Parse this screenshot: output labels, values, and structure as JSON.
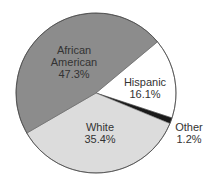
{
  "chart_data": {
    "type": "pie",
    "title": "",
    "categories": [
      "African American",
      "Hispanic",
      "Other",
      "White"
    ],
    "values": [
      47.3,
      16.1,
      1.2,
      35.4
    ],
    "labels": [
      {
        "name": "African American",
        "line1": "African",
        "line2": "American",
        "pct": "47.3%"
      },
      {
        "name": "Hispanic",
        "line1": "Hispanic",
        "pct": "16.1%"
      },
      {
        "name": "Other",
        "line1": "Other",
        "pct": "1.2%"
      },
      {
        "name": "White",
        "line1": "White",
        "pct": "35.4%"
      }
    ],
    "colors": [
      "#8c8c8c",
      "#ffffff",
      "#1a1a1a",
      "#dcdcdc"
    ],
    "start_angle_deg": -39.8,
    "legend": "none (labels on slices)"
  }
}
